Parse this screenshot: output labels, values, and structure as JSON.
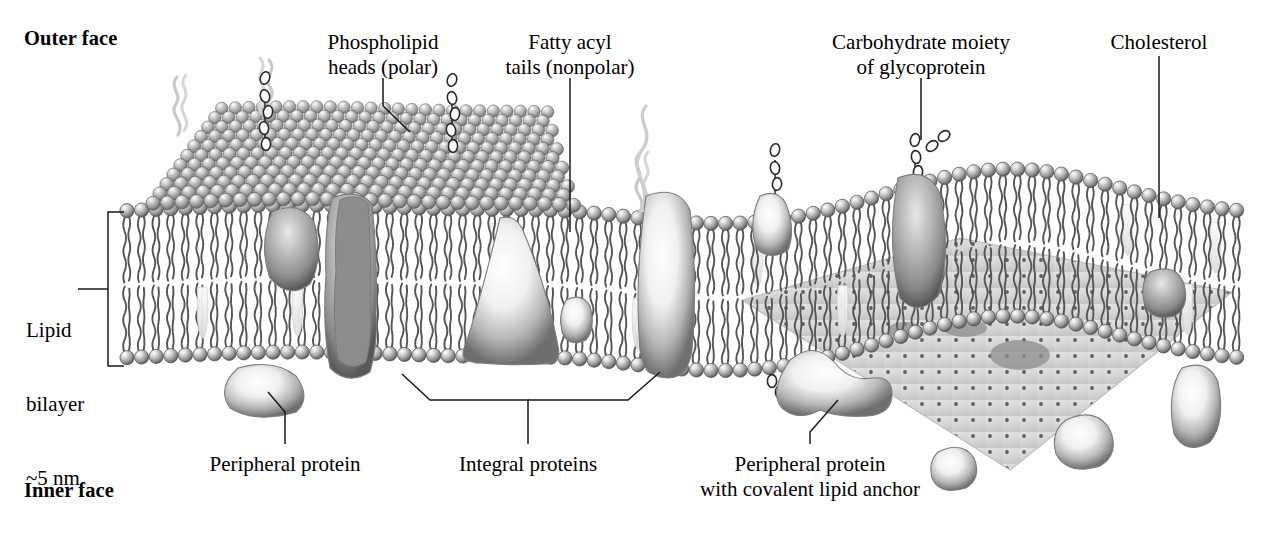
{
  "figure": {
    "type": "diagram",
    "background": "#ffffff"
  },
  "faces": {
    "outer": {
      "text": "Outer face",
      "x": 24,
      "y": 26
    },
    "inner": {
      "text": "Inner face",
      "x": 24,
      "y": 478
    }
  },
  "scale_label": {
    "line1": "Lipid",
    "line2": "bilayer",
    "line3": "~5 nm",
    "x": 26,
    "y": 268
  },
  "labels": [
    {
      "id": "phospholipid-heads",
      "line1": "Phospholipid",
      "line2": "heads (polar)",
      "cx": 383,
      "y": 30
    },
    {
      "id": "fatty-acyl-tails",
      "line1": "Fatty acyl",
      "line2": "tails (nonpolar)",
      "cx": 570,
      "y": 30
    },
    {
      "id": "carbohydrate-moiety",
      "line1": "Carbohydrate moiety",
      "line2": "of glycoprotein",
      "cx": 921,
      "y": 30
    },
    {
      "id": "cholesterol",
      "line1": "Cholesterol",
      "line2": "",
      "cx": 1159,
      "y": 30
    },
    {
      "id": "peripheral-protein",
      "line1": "Peripheral protein",
      "line2": "",
      "cx": 285,
      "y": 452
    },
    {
      "id": "integral-proteins",
      "line1": "Integral proteins",
      "line2": "",
      "cx": 528,
      "y": 452
    },
    {
      "id": "lipid-anchor",
      "line1": "Peripheral protein",
      "line2": "with covalent lipid anchor",
      "cx": 810,
      "y": 452
    }
  ],
  "colors": {
    "ink": "#222222",
    "head_light": "#f2f2f2",
    "head_mid": "#9a9a9a",
    "head_dark": "#5e5e5e",
    "tail": "#555555",
    "protein_light": "#ffffff",
    "protein_mid": "#c9c9c9",
    "protein_dark": "#6d6d6d",
    "cytoskeleton_fill": "#d8d8d8",
    "cytoskeleton_dot": "#5a5a5a",
    "cholesterol": "#eeeeee",
    "leader": "#1a1a1a"
  },
  "structure": {
    "membrane_left_x": 120,
    "membrane_right_x": 1240,
    "head_diameter": 14,
    "bilayer_top_y": 215,
    "bilayer_bottom_y": 362,
    "bracket_x": 108,
    "bracket_top_y": 212,
    "bracket_bottom_y": 366
  },
  "features": {
    "integral_protein_count": 7,
    "peripheral_protein_count": 3,
    "glycoprotein_count": 2,
    "cholesterol_count": 8,
    "free_lipid_chains": 3,
    "cytoskeleton_panel": "stippled cutaway plane on right half"
  }
}
